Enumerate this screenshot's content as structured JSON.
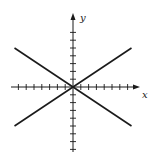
{
  "chart_data": {
    "type": "line",
    "title": "",
    "xlabel": "x",
    "ylabel": "y",
    "xlim": [
      -8,
      8.5
    ],
    "ylim": [
      -8,
      9.5
    ],
    "grid": false,
    "legend": null,
    "x_ticks_each_side": 7,
    "y_ticks_each_side": 7,
    "series": [
      {
        "name": "rising line",
        "x": [
          -7.5,
          7.5
        ],
        "y": [
          -5,
          5
        ]
      },
      {
        "name": "falling line",
        "x": [
          -7.5,
          7.5
        ],
        "y": [
          5,
          -5
        ]
      }
    ],
    "annotations": []
  },
  "colors": {
    "ink": "#1a1a1a",
    "background": "#ffffff"
  }
}
